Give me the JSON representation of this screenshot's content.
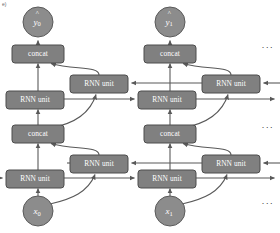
{
  "figure": {
    "type": "neural-network-architecture-diagram",
    "background_color": "#ffffff",
    "node_fill": "#808080",
    "node_stroke": "#4d4d4d",
    "circle_fill": "#8c8c8c",
    "edge_color": "#595959",
    "label_color": "#ffffff"
  },
  "labels": {
    "rnn_unit": "RNN unit",
    "concat": "concat",
    "output_0_base": "y",
    "output_0_sub": "0",
    "output_1_base": "y",
    "output_1_sub": "1",
    "input_0_base": "x",
    "input_0_sub": "0",
    "input_1_base": "x",
    "input_1_sub": "1",
    "ellipsis": "..."
  },
  "timesteps": [
    {
      "index": 0,
      "input": {
        "name": "input-x0",
        "base": "x",
        "sub": "0",
        "cx": 38,
        "cy": 211,
        "r": 15
      },
      "output": {
        "name": "output-y0",
        "base": "y",
        "sub": "0",
        "cx": 38,
        "cy": 22,
        "r": 15
      },
      "concat_upper": {
        "name": "concat-upper-t0",
        "label": "concat",
        "x": 12,
        "y": 45,
        "w": 52,
        "h": 16
      },
      "concat_lower": {
        "name": "concat-lower-t0",
        "label": "concat",
        "x": 12,
        "y": 125,
        "w": 52,
        "h": 16
      },
      "rnn_fwd_upper": {
        "name": "rnn-forward-upper-t0",
        "label": "RNN unit",
        "x": 6,
        "y": 91,
        "w": 58,
        "h": 16
      },
      "rnn_bwd_upper": {
        "name": "rnn-backward-upper-t0",
        "label": "RNN unit",
        "x": 70,
        "y": 75,
        "w": 58,
        "h": 16
      },
      "rnn_fwd_lower": {
        "name": "rnn-forward-lower-t0",
        "label": "RNN unit",
        "x": 6,
        "y": 170,
        "w": 58,
        "h": 16
      },
      "rnn_bwd_lower": {
        "name": "rnn-backward-lower-t0",
        "label": "RNN unit",
        "x": 70,
        "y": 155,
        "w": 58,
        "h": 16
      }
    },
    {
      "index": 1,
      "input": {
        "name": "input-x1",
        "base": "x",
        "sub": "1",
        "cx": 170,
        "cy": 211,
        "r": 15
      },
      "output": {
        "name": "output-y1",
        "base": "y",
        "sub": "1",
        "cx": 170,
        "cy": 22,
        "r": 15
      },
      "concat_upper": {
        "name": "concat-upper-t1",
        "label": "concat",
        "x": 144,
        "y": 45,
        "w": 52,
        "h": 16
      },
      "concat_lower": {
        "name": "concat-lower-t1",
        "label": "concat",
        "x": 144,
        "y": 125,
        "w": 52,
        "h": 16
      },
      "rnn_fwd_upper": {
        "name": "rnn-forward-upper-t1",
        "label": "RNN unit",
        "x": 138,
        "y": 91,
        "w": 58,
        "h": 16
      },
      "rnn_bwd_upper": {
        "name": "rnn-backward-upper-t1",
        "label": "RNN unit",
        "x": 202,
        "y": 75,
        "w": 58,
        "h": 16
      },
      "rnn_fwd_lower": {
        "name": "rnn-forward-lower-t1",
        "label": "RNN unit",
        "x": 138,
        "y": 170,
        "w": 58,
        "h": 16
      },
      "rnn_bwd_lower": {
        "name": "rnn-backward-lower-t1",
        "label": "RNN unit",
        "x": 202,
        "y": 155,
        "w": 58,
        "h": 16
      }
    }
  ],
  "ellipses": [
    {
      "name": "ellipsis-top",
      "text": "...",
      "x": 268,
      "y": 46
    },
    {
      "name": "ellipsis-middle",
      "text": "...",
      "x": 268,
      "y": 126
    },
    {
      "name": "ellipsis-bottom",
      "text": "...",
      "x": 268,
      "y": 202
    }
  ],
  "corner_mark": {
    "name": "corner-mark",
    "text": "e)"
  }
}
